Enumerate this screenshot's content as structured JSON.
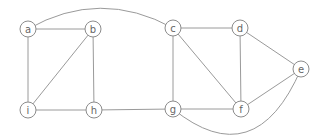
{
  "diagram": {
    "type": "undirected-graph",
    "colors": {
      "background": "#ffffff",
      "edge": "#9a9a9a",
      "node_stroke": "#8c8c8c",
      "label": "#666666"
    },
    "node_radius": 8,
    "nodes": [
      {
        "id": "a",
        "label": "a",
        "x": 28,
        "y": 29
      },
      {
        "id": "b",
        "label": "b",
        "x": 93,
        "y": 29
      },
      {
        "id": "c",
        "label": "c",
        "x": 173,
        "y": 28
      },
      {
        "id": "d",
        "label": "d",
        "x": 240,
        "y": 28
      },
      {
        "id": "e",
        "label": "e",
        "x": 301,
        "y": 69
      },
      {
        "id": "f",
        "label": "f",
        "x": 241,
        "y": 109
      },
      {
        "id": "g",
        "label": "g",
        "x": 173,
        "y": 109
      },
      {
        "id": "h",
        "label": "h",
        "x": 94,
        "y": 110
      },
      {
        "id": "i",
        "label": "i",
        "x": 28,
        "y": 110
      }
    ],
    "edges": [
      {
        "from": "a",
        "to": "b"
      },
      {
        "from": "a",
        "to": "i"
      },
      {
        "from": "b",
        "to": "i"
      },
      {
        "from": "b",
        "to": "h"
      },
      {
        "from": "i",
        "to": "h"
      },
      {
        "from": "h",
        "to": "g"
      },
      {
        "from": "a",
        "to": "c",
        "curve": {
          "cx": 100,
          "cy": -12
        }
      },
      {
        "from": "c",
        "to": "d"
      },
      {
        "from": "c",
        "to": "g"
      },
      {
        "from": "c",
        "to": "f"
      },
      {
        "from": "d",
        "to": "f"
      },
      {
        "from": "d",
        "to": "e"
      },
      {
        "from": "e",
        "to": "f"
      },
      {
        "from": "g",
        "to": "f"
      },
      {
        "from": "g",
        "to": "e",
        "curve": {
          "cx": 255,
          "cy": 175
        }
      }
    ]
  }
}
